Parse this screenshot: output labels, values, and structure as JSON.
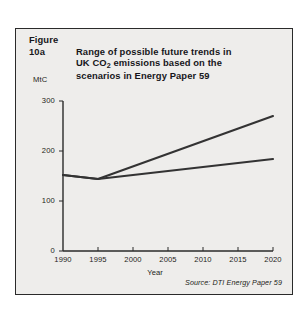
{
  "figure": {
    "label": "Figure 10a",
    "title_line1": "Range of possible future trends in",
    "title_line2_pre": "UK CO",
    "title_line2_sub": "2",
    "title_line2_post": " emissions based on the",
    "title_line3": "scenarios in Energy Paper 59",
    "source_prefix": "Source: ",
    "source_text": "DTI Energy Paper 59",
    "frame_color": "#2a2a2a",
    "background_color": "#eeedeb",
    "line_color": "#333333"
  },
  "chart_data": {
    "type": "line",
    "xlabel": "Year",
    "ylabel": "MtC",
    "ylabel_full": "MtC",
    "xlim": [
      1990,
      2020
    ],
    "ylim": [
      0,
      300
    ],
    "grid": false,
    "legend": "none",
    "x": [
      1990,
      1995,
      2000,
      2005,
      2010,
      2015,
      2020
    ],
    "xticks": [
      "1990",
      "1995",
      "2000",
      "2005",
      "2010",
      "2015",
      "2020"
    ],
    "yticks": [
      "0",
      "100",
      "200",
      "300"
    ],
    "ytick_values": [
      0,
      100,
      200,
      300
    ],
    "series": [
      {
        "name": "High scenario",
        "x": [
          1990,
          1995,
          2020
        ],
        "values": [
          152,
          144,
          270
        ]
      },
      {
        "name": "Low scenario",
        "x": [
          1990,
          1995,
          2020
        ],
        "values": [
          152,
          144,
          184
        ]
      }
    ],
    "annotation": "Source: DTI Energy Paper 59"
  }
}
